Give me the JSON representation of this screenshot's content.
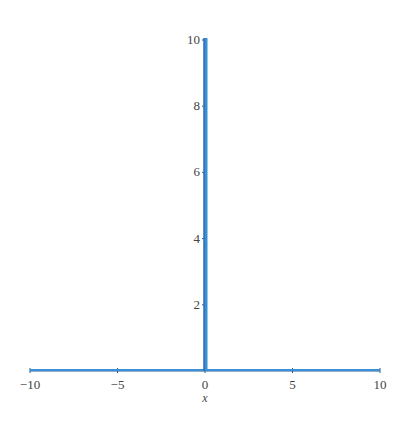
{
  "chart_data": {
    "type": "line",
    "title": "",
    "xlabel": "x",
    "ylabel": "",
    "xlim": [
      -10,
      10
    ],
    "ylim": [
      0,
      10
    ],
    "grid": false,
    "legend": null,
    "x_ticks": [
      -10,
      -5,
      0,
      5,
      10
    ],
    "x_tick_labels": [
      "−10",
      "−5",
      "0",
      "5",
      "10"
    ],
    "y_ticks": [
      2,
      4,
      6,
      8,
      10
    ],
    "y_tick_labels": [
      "2",
      "4",
      "6",
      "8",
      "10"
    ],
    "series": [
      {
        "name": "curve",
        "color": "#3a8fd6",
        "description": "Function is ~0 everywhere except a sharp spike at x=0 reaching the top of the view (>=10)",
        "x": [
          -10,
          -5,
          -1,
          -0.1,
          -0.01,
          0,
          0.01,
          0.1,
          1,
          5,
          10
        ],
        "y": [
          0,
          0,
          0,
          0,
          0,
          10,
          0,
          0,
          0,
          0,
          0
        ]
      }
    ],
    "axis_color": "#2a5a9a"
  }
}
